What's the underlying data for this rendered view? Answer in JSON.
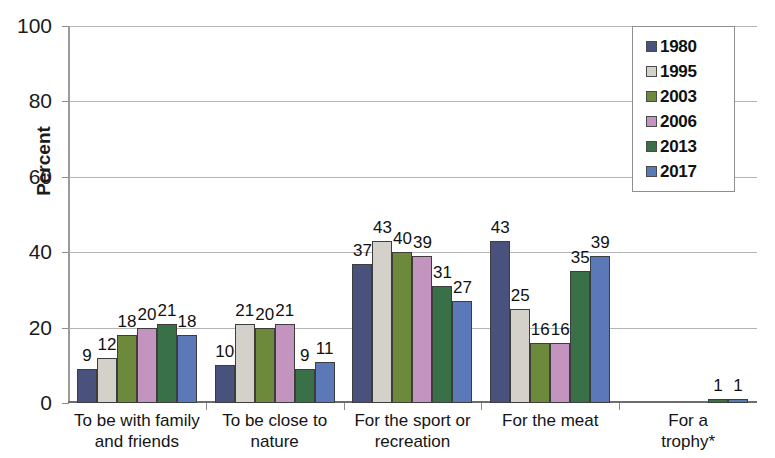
{
  "chart_data": {
    "type": "bar",
    "title": "",
    "subtitle": "",
    "xlabel": "",
    "ylabel": "Percent",
    "ylim": [
      0,
      100
    ],
    "yticks": [
      0,
      20,
      40,
      60,
      80,
      100
    ],
    "grid": true,
    "grid_axis": "y",
    "legend_position": "top-right",
    "categories": [
      "To be with family and friends",
      "To be close to nature",
      "For the sport or recreation",
      "For the meat",
      "For a trophy*"
    ],
    "category_lines": [
      [
        "To be with family",
        "and friends"
      ],
      [
        "To be close to",
        "nature"
      ],
      [
        "For the sport or",
        "recreation"
      ],
      [
        "For the meat"
      ],
      [
        "For a trophy*"
      ]
    ],
    "series": [
      {
        "name": "1980",
        "color": "#49517d",
        "values": [
          9,
          10,
          37,
          43,
          null
        ]
      },
      {
        "name": "1995",
        "color": "#d3d1c9",
        "values": [
          12,
          21,
          43,
          25,
          null
        ]
      },
      {
        "name": "2003",
        "color": "#6d8a3c",
        "values": [
          18,
          20,
          40,
          16,
          null
        ]
      },
      {
        "name": "2006",
        "color": "#c494c0",
        "values": [
          20,
          21,
          39,
          16,
          null
        ]
      },
      {
        "name": "2013",
        "color": "#3a7048",
        "values": [
          21,
          9,
          31,
          35,
          1
        ]
      },
      {
        "name": "2017",
        "color": "#5b78b8",
        "values": [
          18,
          11,
          27,
          39,
          1
        ]
      }
    ],
    "data_labels": [
      [
        "9",
        "12",
        "18",
        "20",
        "21",
        "18"
      ],
      [
        "10",
        "21",
        "20",
        "21",
        "9",
        "11"
      ],
      [
        "37",
        "43",
        "40",
        "39",
        "31",
        "27"
      ],
      [
        "43",
        "25",
        "16",
        "16",
        "35",
        "39"
      ],
      [
        "",
        "",
        "",
        "",
        "1",
        "1"
      ]
    ],
    "legend": {
      "entries": [
        {
          "label": "1980",
          "color": "#49517d"
        },
        {
          "label": "1995",
          "color": "#d3d1c9"
        },
        {
          "label": "2003",
          "color": "#6d8a3c"
        },
        {
          "label": "2006",
          "color": "#c494c0"
        },
        {
          "label": "2013",
          "color": "#3a7048"
        },
        {
          "label": "2017",
          "color": "#5b78b8"
        }
      ]
    }
  }
}
